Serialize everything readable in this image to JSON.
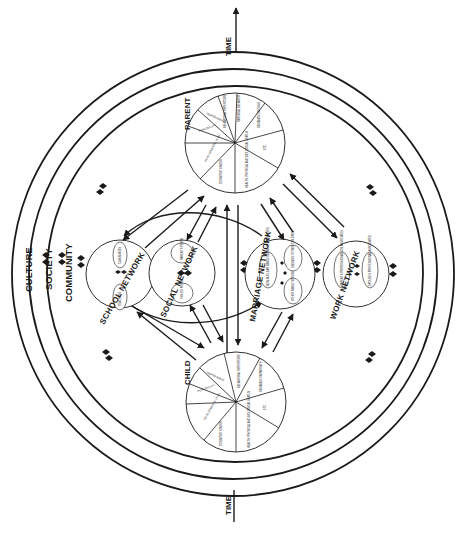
{
  "diagram": {
    "title": "",
    "orientation": "rotated-90-ccw",
    "context_rings": [
      {
        "id": "culture",
        "label": "CULTURE"
      },
      {
        "id": "society",
        "label": "SOCIETY"
      },
      {
        "id": "community",
        "label": "COMMUNITY"
      }
    ],
    "time_axis": {
      "top_label": "TIME",
      "bottom_label": "TIME",
      "direction": "up"
    },
    "person_nodes": [
      {
        "id": "parent",
        "label": "PARENT",
        "segments": [
          "COGNITIVE STATUS",
          "DEVELOPMENTAL LEVEL",
          "PERSONALITY",
          "TEMPERAMENT",
          "BEHAVIORAL REPERTOIRE",
          "PARENTAL BEHAVIOR",
          "DEMANDS ON CHILD",
          "ETC.",
          "HEALTH, PHYSICAL AND BIOLOGICAL STATUS"
        ]
      },
      {
        "id": "child",
        "label": "CHILD",
        "segments": [
          "COGNITIVE STATUS",
          "DEVELOPMENTAL LEVEL",
          "PERSONALITY",
          "TEMPERAMENT",
          "BEHAVIORAL REPERTOIRE",
          "DEMANDS ON PARENTS",
          "ETC.",
          "HEALTH, PHYSICAL AND BIOLOGICAL STATUS"
        ]
      }
    ],
    "network_nodes": [
      {
        "id": "school",
        "label": "SCHOOL NETWORK",
        "members": [
          "TEACHERS",
          "CLASSMATES"
        ]
      },
      {
        "id": "social",
        "label": "SOCIAL NETWORK",
        "members": [
          "CHILD'S PEERS",
          "PARENT'S PEERS"
        ]
      },
      {
        "id": "marriage",
        "label": "MARRIAGE NETWORK",
        "members": [
          "NON-NUCLEAR FAMILY MEMBERS / RELATIVES",
          "OTHER FAMILY SPOUSE",
          "SIBLINGS / OTHER CHILDREN"
        ]
      },
      {
        "id": "work",
        "label": "WORK NETWORK",
        "members": [
          "PARENT'S PROFESSIONAL JOB ASSOCIATES",
          "SPOUSE'S PROFESSIONAL ASSOCIATES"
        ]
      }
    ],
    "relations": [
      {
        "from": "parent",
        "to": "child",
        "type": "bidirectional"
      },
      {
        "from": "parent",
        "to": "school",
        "type": "bidirectional"
      },
      {
        "from": "parent",
        "to": "social",
        "type": "bidirectional"
      },
      {
        "from": "parent",
        "to": "marriage",
        "type": "bidirectional"
      },
      {
        "from": "parent",
        "to": "work",
        "type": "bidirectional"
      },
      {
        "from": "child",
        "to": "school",
        "type": "bidirectional"
      },
      {
        "from": "child",
        "to": "social",
        "type": "bidirectional"
      },
      {
        "from": "child",
        "to": "marriage",
        "type": "bidirectional"
      },
      {
        "from": "school",
        "to": "marriage",
        "type": "bidirectional-curved"
      }
    ]
  }
}
